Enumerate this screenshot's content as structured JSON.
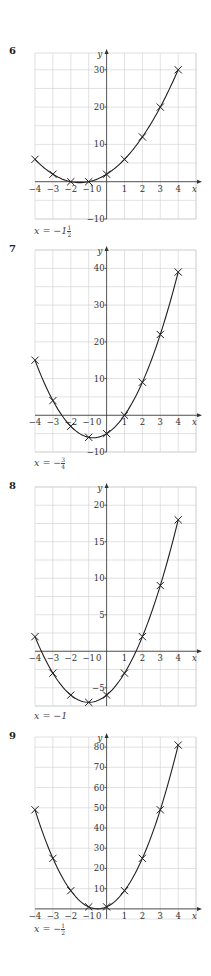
{
  "chart_data": [
    {
      "type": "line",
      "question": "6",
      "title": "",
      "xlabel": "x",
      "ylabel": "y",
      "x": [
        -4,
        -3,
        -2,
        -1,
        0,
        1,
        2,
        3,
        4
      ],
      "series": [
        {
          "name": "curve",
          "values": [
            6,
            2,
            0,
            0,
            2,
            6,
            12,
            20,
            30
          ]
        }
      ],
      "xlim": [
        -4,
        4.5
      ],
      "ylim": [
        -10,
        34
      ],
      "x_ticks": [
        "-4",
        "-3",
        "-2",
        "-1",
        "0",
        "1",
        "2",
        "3",
        "4"
      ],
      "y_ticks": [
        30,
        20,
        10,
        -10
      ],
      "y_tick_step_labels": 10,
      "y_grid_step": 5,
      "grid": true,
      "markers": "x",
      "answer": "x = -1½",
      "answer_parts": {
        "prefix": "x = −1",
        "num": "1",
        "den": "2"
      }
    },
    {
      "type": "line",
      "question": "7",
      "title": "",
      "xlabel": "x",
      "ylabel": "y",
      "x": [
        -4,
        -3,
        -2,
        -1,
        0,
        1,
        2,
        3,
        4
      ],
      "series": [
        {
          "name": "curve",
          "values": [
            15,
            4,
            -3,
            -6,
            -5,
            0,
            9,
            22,
            39
          ]
        }
      ],
      "xlim": [
        -4,
        4.5
      ],
      "ylim": [
        -10,
        45
      ],
      "x_ticks": [
        "-4",
        "-3",
        "-2",
        "-1",
        "0",
        "1",
        "2",
        "3",
        "4"
      ],
      "y_ticks": [
        40,
        30,
        20,
        10,
        -10
      ],
      "y_grid_step": 5,
      "grid": true,
      "markers": "x",
      "answer": "x = -3/4",
      "answer_parts": {
        "prefix": "x = −",
        "num": "3",
        "den": "4"
      }
    },
    {
      "type": "line",
      "question": "8",
      "title": "",
      "xlabel": "x",
      "ylabel": "y",
      "x": [
        -4,
        -3,
        -2,
        -1,
        0,
        1,
        2,
        3,
        4
      ],
      "series": [
        {
          "name": "curve",
          "values": [
            2,
            -3,
            -6,
            -7,
            -6,
            -3,
            2,
            9,
            18
          ]
        }
      ],
      "xlim": [
        -4,
        4.5
      ],
      "ylim": [
        -7.5,
        22
      ],
      "x_ticks": [
        "-4",
        "-3",
        "-2",
        "-1",
        "0",
        "1",
        "2",
        "3",
        "4"
      ],
      "y_ticks": [
        20,
        15,
        10,
        5,
        -5
      ],
      "y_grid_step": 2.5,
      "grid": true,
      "markers": "x",
      "answer": "x = -1",
      "answer_parts": {
        "prefix": "x = −1",
        "num": "",
        "den": ""
      }
    },
    {
      "type": "line",
      "question": "9",
      "title": "",
      "xlabel": "x",
      "ylabel": "y",
      "x": [
        -4,
        -3,
        -2,
        -1,
        0,
        1,
        2,
        3,
        4
      ],
      "series": [
        {
          "name": "curve",
          "values": [
            49,
            25,
            9,
            1,
            1,
            9,
            25,
            49,
            81
          ]
        }
      ],
      "xlim": [
        -4,
        4.5
      ],
      "ylim": [
        -10,
        90
      ],
      "x_ticks": [
        "-4",
        "-3",
        "-2",
        "-1",
        "0",
        "1",
        "2",
        "3",
        "4"
      ],
      "y_ticks": [
        80,
        70,
        60,
        50,
        40,
        30,
        20,
        10
      ],
      "y_grid_step": 10,
      "grid": true,
      "markers": "x",
      "answer": "x = -1/2",
      "answer_parts": {
        "prefix": "x = −",
        "num": "1",
        "den": "2"
      }
    }
  ],
  "layout": [
    {
      "qnum_top": 45,
      "grid_top": 53,
      "grid_bottom": 219,
      "y_top_val": 34.5,
      "y_bot_val": -10,
      "label_top": 225
    },
    {
      "qnum_top": 243,
      "grid_top": 250,
      "grid_bottom": 452,
      "y_top_val": 45,
      "y_bot_val": -10,
      "label_top": 457
    },
    {
      "qnum_top": 480,
      "grid_top": 487,
      "grid_bottom": 706,
      "y_top_val": 22.5,
      "y_bot_val": -7.5,
      "label_top": 710
    },
    {
      "qnum_top": 730,
      "grid_top": 737,
      "grid_bottom": 919,
      "y_top_val": 85,
      "y_bot_val": -5,
      "label_top": 923
    }
  ]
}
